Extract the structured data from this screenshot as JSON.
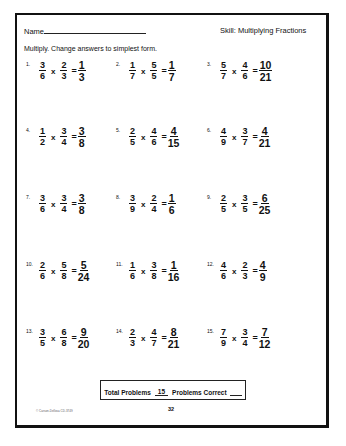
{
  "header": {
    "name_label": "Name",
    "skill": "Skill:  Multiplying Fractions"
  },
  "instructions": "Multiply. Change answers to simplest form.",
  "problems": [
    {
      "num": "1.",
      "a": {
        "n": "3",
        "d": "6"
      },
      "b": {
        "n": "2",
        "d": "3"
      },
      "ans": {
        "n": "1",
        "d": "3"
      }
    },
    {
      "num": "2.",
      "a": {
        "n": "1",
        "d": "7"
      },
      "b": {
        "n": "5",
        "d": "5"
      },
      "ans": {
        "n": "1",
        "d": "7"
      }
    },
    {
      "num": "3.",
      "a": {
        "n": "5",
        "d": "7"
      },
      "b": {
        "n": "4",
        "d": "6"
      },
      "ans": {
        "n": "10",
        "d": "21"
      }
    },
    {
      "num": "4.",
      "a": {
        "n": "1",
        "d": "2"
      },
      "b": {
        "n": "3",
        "d": "4"
      },
      "ans": {
        "n": "3",
        "d": "8"
      }
    },
    {
      "num": "5.",
      "a": {
        "n": "2",
        "d": "5"
      },
      "b": {
        "n": "4",
        "d": "6"
      },
      "ans": {
        "n": "4",
        "d": "15"
      }
    },
    {
      "num": "6.",
      "a": {
        "n": "4",
        "d": "9"
      },
      "b": {
        "n": "3",
        "d": "7"
      },
      "ans": {
        "n": "4",
        "d": "21"
      }
    },
    {
      "num": "7.",
      "a": {
        "n": "3",
        "d": "6"
      },
      "b": {
        "n": "3",
        "d": "4"
      },
      "ans": {
        "n": "3",
        "d": "8"
      }
    },
    {
      "num": "8.",
      "a": {
        "n": "3",
        "d": "9"
      },
      "b": {
        "n": "2",
        "d": "4"
      },
      "ans": {
        "n": "1",
        "d": "6"
      }
    },
    {
      "num": "9.",
      "a": {
        "n": "2",
        "d": "5"
      },
      "b": {
        "n": "3",
        "d": "5"
      },
      "ans": {
        "n": "6",
        "d": "25"
      }
    },
    {
      "num": "10.",
      "a": {
        "n": "2",
        "d": "6"
      },
      "b": {
        "n": "5",
        "d": "8"
      },
      "ans": {
        "n": "5",
        "d": "24"
      }
    },
    {
      "num": "11.",
      "a": {
        "n": "1",
        "d": "6"
      },
      "b": {
        "n": "3",
        "d": "8"
      },
      "ans": {
        "n": "1",
        "d": "16"
      }
    },
    {
      "num": "12.",
      "a": {
        "n": "4",
        "d": "6"
      },
      "b": {
        "n": "2",
        "d": "3"
      },
      "ans": {
        "n": "4",
        "d": "9"
      }
    },
    {
      "num": "13.",
      "a": {
        "n": "3",
        "d": "5"
      },
      "b": {
        "n": "6",
        "d": "8"
      },
      "ans": {
        "n": "9",
        "d": "20"
      }
    },
    {
      "num": "14.",
      "a": {
        "n": "2",
        "d": "3"
      },
      "b": {
        "n": "4",
        "d": "7"
      },
      "ans": {
        "n": "8",
        "d": "21"
      }
    },
    {
      "num": "15.",
      "a": {
        "n": "7",
        "d": "9"
      },
      "b": {
        "n": "3",
        "d": "4"
      },
      "ans": {
        "n": "7",
        "d": "12"
      }
    }
  ],
  "operator": "x",
  "equals": "=",
  "footer": {
    "total_label": "Total Problems",
    "total_value": "15",
    "correct_label": "Problems Correct",
    "copyright": "© Carson-Dellosa CD-3749",
    "page_number": "32"
  }
}
